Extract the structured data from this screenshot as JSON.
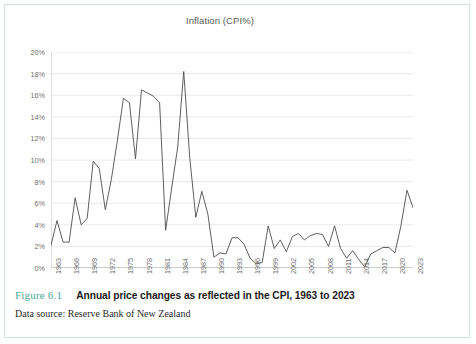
{
  "figure": {
    "number_label": "Figure 6.1",
    "caption": "Annual price changes as reflected in the CPI, 1963 to 2023",
    "data_source": "Data source: Reserve Bank of New Zealand",
    "accent_color": "#4aa89a",
    "border_color": "#cfe3e0"
  },
  "chart_data": {
    "type": "line",
    "title": "Inflation (CPI%)",
    "xlabel": "",
    "ylabel": "",
    "ylim": [
      0,
      20
    ],
    "ytick_labels": [
      "0%",
      "2%",
      "4%",
      "6%",
      "8%",
      "10%",
      "12%",
      "14%",
      "16%",
      "18%",
      "20%"
    ],
    "ytick_values": [
      0,
      2,
      4,
      6,
      8,
      10,
      12,
      14,
      16,
      18,
      20
    ],
    "xlim": [
      1963,
      2023
    ],
    "xtick_labels": [
      "1963",
      "1966",
      "1969",
      "1972",
      "1975",
      "1978",
      "1981",
      "1984",
      "1987",
      "1990",
      "1993",
      "1996",
      "1999",
      "2002",
      "2005",
      "2008",
      "2011",
      "2014",
      "2017",
      "2020",
      "2023"
    ],
    "xtick_values": [
      1963,
      1966,
      1969,
      1972,
      1975,
      1978,
      1981,
      1984,
      1987,
      1990,
      1993,
      1996,
      1999,
      2002,
      2005,
      2008,
      2011,
      2014,
      2017,
      2020,
      2023
    ],
    "grid": "horizontal",
    "legend": "none",
    "line_color": "#4d4d4d",
    "x": [
      1963,
      1964,
      1965,
      1966,
      1967,
      1968,
      1969,
      1970,
      1971,
      1972,
      1973,
      1974,
      1975,
      1976,
      1977,
      1978,
      1979,
      1980,
      1981,
      1982,
      1983,
      1984,
      1985,
      1986,
      1987,
      1988,
      1989,
      1990,
      1991,
      1992,
      1993,
      1994,
      1995,
      1996,
      1997,
      1998,
      1999,
      2000,
      2001,
      2002,
      2003,
      2004,
      2005,
      2006,
      2007,
      2008,
      2009,
      2010,
      2011,
      2012,
      2013,
      2014,
      2015,
      2016,
      2017,
      2018,
      2019,
      2020,
      2021,
      2022,
      2023
    ],
    "values": [
      2.1,
      4.4,
      2.4,
      2.4,
      6.5,
      4.0,
      4.6,
      9.9,
      9.2,
      5.4,
      8.2,
      11.8,
      15.7,
      15.3,
      10.1,
      16.5,
      16.2,
      15.9,
      15.3,
      3.5,
      7.4,
      11.2,
      18.2,
      10.2,
      4.7,
      7.1,
      5.0,
      1.0,
      1.4,
      1.3,
      2.8,
      2.8,
      2.2,
      0.9,
      0.4,
      0.5,
      3.9,
      1.8,
      2.6,
      1.5,
      2.9,
      3.2,
      2.6,
      3.0,
      3.2,
      3.1,
      2.0,
      3.9,
      1.8,
      0.9,
      1.6,
      0.8,
      0.1,
      1.3,
      1.6,
      1.9,
      1.9,
      1.4,
      3.9,
      7.2,
      5.6
    ]
  }
}
